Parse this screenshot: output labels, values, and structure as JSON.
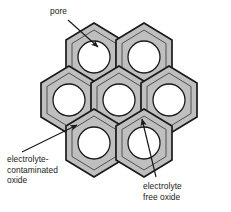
{
  "figure": {
    "kind": "schematic-diagram",
    "width": 231,
    "height": 212,
    "background_color": "#ffffff"
  },
  "colors": {
    "cell_fill": "#bfbfbf",
    "pore_fill": "#ffffff",
    "outline": "#1a1a1a",
    "inner_outline": "#404040",
    "text": "#1a1a1a",
    "leader": "#1a1a1a"
  },
  "labels": {
    "pore": "pore",
    "contaminated": "electrolyte-\ncontaminated\noxide",
    "free": "electrolyte\nfree oxide"
  },
  "structure": {
    "cell_count": 7,
    "cell_shape": "hexagon-pointy-top",
    "rows": [
      {
        "name": "top-row",
        "cells": 2
      },
      {
        "name": "middle-row",
        "cells": 3
      },
      {
        "name": "bottom-row",
        "cells": 2
      }
    ],
    "pore_shape": "circle",
    "cells": [
      {
        "id": "cell-top-left",
        "cx": 94,
        "cy": 57
      },
      {
        "id": "cell-top-right",
        "cx": 144,
        "cy": 57
      },
      {
        "id": "cell-middle-left",
        "cx": 69,
        "cy": 100
      },
      {
        "id": "cell-middle-center",
        "cx": 119,
        "cy": 100
      },
      {
        "id": "cell-middle-right",
        "cx": 169,
        "cy": 100
      },
      {
        "id": "cell-bottom-left",
        "cx": 94,
        "cy": 143
      },
      {
        "id": "cell-bottom-right",
        "cx": 144,
        "cy": 143
      }
    ]
  },
  "annotations": [
    {
      "id": "pore-annotation",
      "label_key": "pore",
      "points_to": "cell-top-left pore interior",
      "arrow_from": [
        68,
        20
      ],
      "arrow_to": [
        99,
        48
      ]
    },
    {
      "id": "contaminated-annotation",
      "label_key": "contaminated",
      "points_to": "hexagon wall between cells",
      "arrow_from": [
        22,
        152
      ],
      "arrow_to": [
        78,
        124
      ]
    },
    {
      "id": "free-annotation",
      "label_key": "free",
      "points_to": "hexagon cell body interior wall",
      "arrow_from": [
        156,
        177
      ],
      "arrow_to": [
        141,
        118
      ]
    }
  ]
}
